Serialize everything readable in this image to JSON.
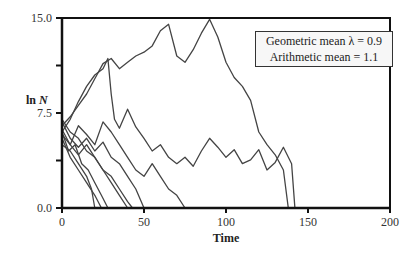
{
  "chart_data": {
    "type": "line",
    "title": "",
    "xlabel": "Time",
    "ylabel": "ln N",
    "xlim": [
      0,
      200
    ],
    "ylim": [
      0,
      15
    ],
    "x_ticks": [
      "0",
      "50",
      "100",
      "150",
      "200"
    ],
    "y_ticks": [
      "0.0",
      "7.5",
      "15.0"
    ],
    "y_minor_ticks": [
      3.75,
      11.25
    ],
    "grid": false,
    "annotation": {
      "line1": "Geometric mean λ = 0.9",
      "line2": "Arithmetic mean = 1.1"
    },
    "series": [
      {
        "name": "run-1",
        "points": [
          [
            0,
            6.5
          ],
          [
            5,
            7.2
          ],
          [
            10,
            8.1
          ],
          [
            15,
            9.0
          ],
          [
            20,
            10.2
          ],
          [
            25,
            11.4
          ],
          [
            30,
            11.8
          ],
          [
            35,
            11.0
          ],
          [
            40,
            11.5
          ],
          [
            45,
            12.0
          ],
          [
            50,
            12.3
          ],
          [
            55,
            12.8
          ],
          [
            60,
            14.0
          ],
          [
            65,
            14.5
          ],
          [
            70,
            12.0
          ],
          [
            75,
            11.5
          ],
          [
            80,
            12.5
          ],
          [
            85,
            13.8
          ],
          [
            90,
            14.9
          ],
          [
            95,
            13.5
          ],
          [
            100,
            11.5
          ],
          [
            105,
            10.3
          ],
          [
            110,
            9.6
          ],
          [
            115,
            8.5
          ],
          [
            120,
            6.0
          ],
          [
            125,
            5.0
          ],
          [
            130,
            4.2
          ],
          [
            135,
            3.0
          ],
          [
            138,
            0.0
          ]
        ]
      },
      {
        "name": "run-2",
        "points": [
          [
            0,
            6.0
          ],
          [
            5,
            7.0
          ],
          [
            10,
            8.4
          ],
          [
            15,
            9.6
          ],
          [
            20,
            10.5
          ],
          [
            25,
            11.0
          ],
          [
            28,
            11.8
          ],
          [
            30,
            9.0
          ],
          [
            32,
            7.0
          ],
          [
            35,
            6.3
          ],
          [
            40,
            7.8
          ],
          [
            45,
            6.4
          ],
          [
            50,
            5.5
          ],
          [
            55,
            4.5
          ],
          [
            60,
            5.0
          ],
          [
            65,
            4.0
          ],
          [
            70,
            3.5
          ],
          [
            75,
            4.0
          ],
          [
            80,
            3.3
          ],
          [
            85,
            4.5
          ],
          [
            90,
            5.5
          ],
          [
            95,
            4.8
          ],
          [
            100,
            4.0
          ],
          [
            105,
            4.6
          ],
          [
            110,
            3.5
          ],
          [
            115,
            3.8
          ],
          [
            120,
            4.6
          ],
          [
            125,
            3.0
          ],
          [
            130,
            3.6
          ],
          [
            135,
            4.8
          ],
          [
            140,
            3.5
          ],
          [
            142,
            0.0
          ]
        ]
      },
      {
        "name": "run-3",
        "points": [
          [
            0,
            6.2
          ],
          [
            5,
            5.0
          ],
          [
            10,
            6.5
          ],
          [
            15,
            5.8
          ],
          [
            20,
            5.0
          ],
          [
            25,
            6.8
          ],
          [
            30,
            6.0
          ],
          [
            35,
            5.0
          ],
          [
            40,
            4.0
          ],
          [
            45,
            3.0
          ],
          [
            50,
            2.5
          ],
          [
            55,
            3.5
          ],
          [
            60,
            2.5
          ],
          [
            65,
            1.5
          ],
          [
            70,
            1.0
          ],
          [
            75,
            0.0
          ]
        ]
      },
      {
        "name": "run-4",
        "points": [
          [
            0,
            6.8
          ],
          [
            5,
            5.5
          ],
          [
            10,
            4.8
          ],
          [
            15,
            5.5
          ],
          [
            20,
            4.5
          ],
          [
            25,
            5.2
          ],
          [
            30,
            4.0
          ],
          [
            35,
            3.5
          ],
          [
            40,
            2.5
          ],
          [
            45,
            1.5
          ],
          [
            50,
            0.0
          ]
        ]
      },
      {
        "name": "run-5",
        "points": [
          [
            0,
            6.0
          ],
          [
            4,
            4.5
          ],
          [
            8,
            5.0
          ],
          [
            12,
            3.5
          ],
          [
            16,
            3.0
          ],
          [
            20,
            2.0
          ],
          [
            24,
            1.0
          ],
          [
            28,
            0.0
          ]
        ]
      },
      {
        "name": "run-6",
        "points": [
          [
            0,
            5.5
          ],
          [
            5,
            4.0
          ],
          [
            10,
            3.0
          ],
          [
            15,
            2.0
          ],
          [
            20,
            1.0
          ],
          [
            24,
            0.0
          ]
        ]
      },
      {
        "name": "run-7",
        "points": [
          [
            0,
            5.8
          ],
          [
            5,
            5.0
          ],
          [
            10,
            4.2
          ],
          [
            15,
            5.0
          ],
          [
            20,
            4.0
          ],
          [
            25,
            3.0
          ],
          [
            30,
            2.5
          ],
          [
            35,
            1.5
          ],
          [
            40,
            0.5
          ],
          [
            43,
            0.0
          ]
        ]
      },
      {
        "name": "run-8",
        "points": [
          [
            0,
            7.0
          ],
          [
            5,
            6.0
          ],
          [
            10,
            5.5
          ],
          [
            15,
            4.5
          ],
          [
            20,
            4.0
          ],
          [
            25,
            3.0
          ],
          [
            30,
            2.0
          ],
          [
            35,
            1.0
          ],
          [
            40,
            0.0
          ]
        ]
      },
      {
        "name": "run-9",
        "points": [
          [
            0,
            5.0
          ],
          [
            5,
            4.5
          ],
          [
            10,
            3.5
          ],
          [
            15,
            2.5
          ],
          [
            18,
            1.5
          ],
          [
            20,
            0.0
          ]
        ]
      }
    ]
  }
}
